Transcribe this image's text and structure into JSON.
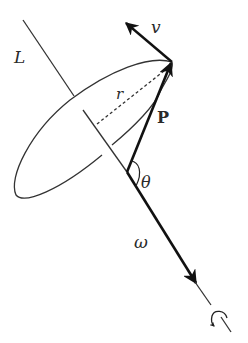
{
  "figure": {
    "type": "physics-diagram",
    "labels": {
      "L": "L",
      "v": "v",
      "r": "r",
      "P": "P",
      "theta": "θ",
      "omega": "ω"
    },
    "colors": {
      "line": "#333333",
      "arrow": "#111111",
      "background": "#ffffff"
    }
  }
}
